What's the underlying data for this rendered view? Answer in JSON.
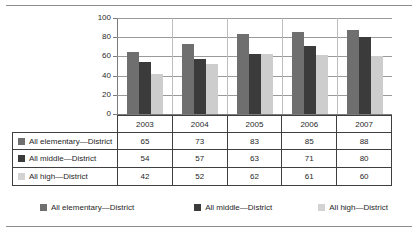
{
  "chart_data": {
    "type": "bar",
    "title": "",
    "xlabel": "",
    "ylabel": "",
    "categories": [
      "2003",
      "2004",
      "2005",
      "2006",
      "2007"
    ],
    "ylim": [
      0,
      100
    ],
    "yticks": [
      0,
      20,
      40,
      60,
      80,
      100
    ],
    "grid": true,
    "legend_position": "bottom",
    "series": [
      {
        "name": "All elementary—District",
        "color": "#6f6f6f",
        "values": [
          65,
          73,
          83,
          85,
          88
        ]
      },
      {
        "name": "All middle—District",
        "color": "#3b3b3b",
        "values": [
          54,
          57,
          63,
          71,
          80
        ]
      },
      {
        "name": "All high—District",
        "color": "#cdcdcd",
        "values": [
          42,
          52,
          62,
          61,
          60
        ]
      }
    ]
  },
  "axis": {
    "ytick_labels": [
      "100",
      "80",
      "60",
      "40",
      "20",
      "0"
    ]
  },
  "table": {
    "year_headers": [
      "2003",
      "2004",
      "2005",
      "2006",
      "2007"
    ],
    "rows": [
      {
        "label": "All elementary—District",
        "values": [
          "65",
          "73",
          "83",
          "85",
          "88"
        ]
      },
      {
        "label": "All middle—District",
        "values": [
          "54",
          "57",
          "63",
          "71",
          "80"
        ]
      },
      {
        "label": "All high—District",
        "values": [
          "42",
          "52",
          "62",
          "61",
          "60"
        ]
      }
    ]
  },
  "legend": {
    "items": [
      {
        "label": "All elementary—District"
      },
      {
        "label": "All middle—District"
      },
      {
        "label": "All high—District"
      }
    ]
  }
}
